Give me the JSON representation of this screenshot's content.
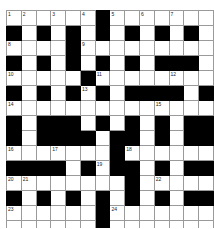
{
  "header": {
    "clipped_text": "— ——  ———"
  },
  "puzzle": {
    "type": "crossword-grid",
    "columns": 14,
    "rows": 15,
    "cell_size_px": 14,
    "colors": {
      "block": "#000000",
      "open": "#ffffff",
      "gridline": "#9a9a9a",
      "number": "#1a1a1a"
    },
    "legend": {
      "0": "open cell",
      "1": "black block"
    },
    "blocks": [
      [
        0,
        0,
        0,
        0,
        0,
        0,
        1,
        0,
        0,
        0,
        0,
        0,
        0,
        0
      ],
      [
        1,
        0,
        1,
        0,
        1,
        0,
        1,
        0,
        1,
        0,
        1,
        0,
        1,
        0
      ],
      [
        0,
        0,
        0,
        0,
        1,
        0,
        0,
        0,
        0,
        0,
        0,
        0,
        0,
        0
      ],
      [
        1,
        0,
        1,
        0,
        1,
        0,
        1,
        0,
        1,
        0,
        1,
        1,
        1,
        0
      ],
      [
        0,
        0,
        0,
        0,
        0,
        1,
        0,
        0,
        0,
        0,
        0,
        0,
        0,
        0
      ],
      [
        1,
        0,
        1,
        0,
        1,
        0,
        1,
        0,
        1,
        1,
        1,
        1,
        0,
        1
      ],
      [
        0,
        0,
        0,
        0,
        0,
        0,
        0,
        0,
        0,
        0,
        0,
        0,
        0,
        0
      ],
      [
        1,
        0,
        1,
        1,
        1,
        0,
        1,
        0,
        1,
        0,
        1,
        0,
        1,
        1
      ],
      [
        1,
        0,
        1,
        1,
        1,
        1,
        0,
        1,
        1,
        0,
        1,
        0,
        1,
        1
      ],
      [
        0,
        0,
        0,
        0,
        0,
        0,
        0,
        1,
        0,
        0,
        0,
        0,
        0,
        0
      ],
      [
        1,
        1,
        1,
        1,
        0,
        1,
        0,
        1,
        1,
        0,
        1,
        0,
        1,
        1
      ],
      [
        0,
        0,
        0,
        0,
        0,
        0,
        0,
        0,
        1,
        0,
        0,
        0,
        0,
        0
      ],
      [
        1,
        0,
        1,
        0,
        1,
        0,
        1,
        0,
        1,
        0,
        1,
        0,
        1,
        1
      ],
      [
        0,
        0,
        0,
        0,
        0,
        0,
        1,
        0,
        0,
        0,
        0,
        0,
        0,
        0
      ],
      [
        0,
        0,
        0,
        0,
        0,
        0,
        1,
        0,
        0,
        0,
        0,
        0,
        0,
        0
      ]
    ],
    "numbers": [
      {
        "row": 0,
        "col": 0,
        "label": "1"
      },
      {
        "row": 0,
        "col": 1,
        "label": "2"
      },
      {
        "row": 0,
        "col": 3,
        "label": "3"
      },
      {
        "row": 0,
        "col": 5,
        "label": "4"
      },
      {
        "row": 0,
        "col": 7,
        "label": "5"
      },
      {
        "row": 0,
        "col": 9,
        "label": "6"
      },
      {
        "row": 0,
        "col": 11,
        "label": "7"
      },
      {
        "row": 2,
        "col": 0,
        "label": "8"
      },
      {
        "row": 2,
        "col": 5,
        "label": "9"
      },
      {
        "row": 4,
        "col": 0,
        "label": "10"
      },
      {
        "row": 4,
        "col": 6,
        "label": "11"
      },
      {
        "row": 4,
        "col": 11,
        "label": "12"
      },
      {
        "row": 5,
        "col": 5,
        "label": "13"
      },
      {
        "row": 6,
        "col": 0,
        "label": "14"
      },
      {
        "row": 6,
        "col": 10,
        "label": "15"
      },
      {
        "row": 9,
        "col": 0,
        "label": "16"
      },
      {
        "row": 9,
        "col": 3,
        "label": "17"
      },
      {
        "row": 9,
        "col": 8,
        "label": "18"
      },
      {
        "row": 10,
        "col": 6,
        "label": "19"
      },
      {
        "row": 11,
        "col": 0,
        "label": "20"
      },
      {
        "row": 11,
        "col": 1,
        "label": "21"
      },
      {
        "row": 11,
        "col": 10,
        "label": "22"
      },
      {
        "row": 13,
        "col": 0,
        "label": "23"
      },
      {
        "row": 13,
        "col": 7,
        "label": "24"
      }
    ]
  }
}
